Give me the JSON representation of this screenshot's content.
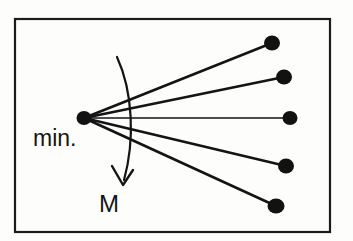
{
  "figure": {
    "background_color": "#fdfdfc",
    "ink_color": "#141414",
    "frame": {
      "x": 15,
      "y": 19,
      "width": 315,
      "height": 213,
      "stroke_width": 2.2
    },
    "labels": {
      "minimum": "min.",
      "moment": "M"
    },
    "label_positions": {
      "minimum": {
        "x": 33,
        "y": 146
      },
      "moment": {
        "x": 99,
        "y": 212
      }
    },
    "vertex": {
      "name": "min.",
      "x": 84,
      "y": 118,
      "dot_rx": 7.5,
      "dot_ry": 7.0
    },
    "rays": [
      {
        "id": "ray-1",
        "x2": 272,
        "y2": 43,
        "stroke_width": 2.6,
        "dot_rx": 8.0,
        "dot_ry": 7.5
      },
      {
        "id": "ray-2",
        "x2": 284,
        "y2": 77,
        "stroke_width": 2.6,
        "dot_rx": 8.0,
        "dot_ry": 7.5
      },
      {
        "id": "ray-3",
        "x2": 290,
        "y2": 118,
        "stroke_width": 1.5,
        "dot_rx": 7.5,
        "dot_ry": 7.0
      },
      {
        "id": "ray-4",
        "x2": 286,
        "y2": 166,
        "stroke_width": 2.6,
        "dot_rx": 8.0,
        "dot_ry": 7.5
      },
      {
        "id": "ray-5",
        "x2": 276,
        "y2": 206,
        "stroke_width": 2.6,
        "dot_rx": 8.5,
        "dot_ry": 7.5
      }
    ],
    "moment_arc": {
      "path": "M 117,57 C 133,92 135,140 124,180",
      "arrow_head": "M 112,166 L 123,185 L 133,170"
    }
  }
}
